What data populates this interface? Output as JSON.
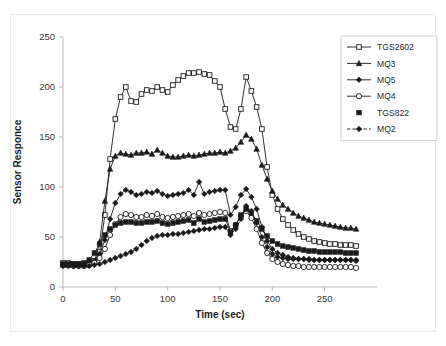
{
  "chart_data": {
    "type": "line",
    "title": "",
    "xlabel": "Time (sec)",
    "ylabel": "Sensor Responce",
    "xlim": [
      0,
      300
    ],
    "ylim": [
      0,
      250
    ],
    "xticks": [
      0,
      50,
      100,
      150,
      200,
      250
    ],
    "yticks": [
      0,
      50,
      100,
      150,
      200,
      250
    ],
    "grid": false,
    "legend_position": "top-right",
    "x": [
      0,
      5,
      10,
      15,
      20,
      25,
      30,
      35,
      40,
      45,
      50,
      55,
      60,
      65,
      70,
      75,
      80,
      85,
      90,
      95,
      100,
      105,
      110,
      115,
      120,
      125,
      130,
      135,
      140,
      145,
      150,
      155,
      160,
      165,
      170,
      175,
      180,
      185,
      190,
      195,
      200,
      205,
      210,
      215,
      220,
      225,
      230,
      235,
      240,
      245,
      250,
      255,
      260,
      265,
      270,
      275,
      280
    ],
    "series": [
      {
        "name": "TGS2602",
        "marker": "open-square",
        "dashed": false,
        "values": [
          24,
          24,
          23,
          23,
          23,
          24,
          26,
          35,
          72,
          128,
          168,
          190,
          200,
          186,
          185,
          193,
          197,
          196,
          200,
          197,
          195,
          202,
          207,
          211,
          214,
          214,
          215,
          213,
          212,
          206,
          200,
          178,
          160,
          158,
          178,
          210,
          196,
          180,
          158,
          120,
          92,
          78,
          68,
          62,
          57,
          53,
          50,
          48,
          46,
          45,
          44,
          43,
          43,
          42,
          42,
          42,
          41
        ]
      },
      {
        "name": "MQ3",
        "marker": "solid-triangle",
        "dashed": false,
        "values": [
          22,
          22,
          22,
          22,
          22,
          23,
          25,
          45,
          86,
          118,
          131,
          134,
          133,
          132,
          134,
          134,
          135,
          133,
          137,
          134,
          131,
          130,
          130,
          131,
          132,
          131,
          132,
          133,
          134,
          134,
          135,
          134,
          136,
          139,
          145,
          152,
          148,
          138,
          122,
          108,
          96,
          88,
          82,
          78,
          74,
          71,
          69,
          67,
          65,
          64,
          63,
          62,
          61,
          60,
          59,
          59,
          58
        ]
      },
      {
        "name": "MQ5",
        "marker": "solid-diamond",
        "dashed": false,
        "values": [
          22,
          22,
          22,
          22,
          22,
          23,
          26,
          33,
          47,
          68,
          84,
          93,
          97,
          95,
          92,
          93,
          95,
          94,
          96,
          93,
          91,
          92,
          93,
          94,
          97,
          92,
          105,
          93,
          95,
          96,
          97,
          97,
          72,
          80,
          92,
          98,
          90,
          78,
          60,
          46,
          38,
          34,
          32,
          30,
          29,
          28,
          28,
          27,
          27,
          27,
          27,
          27,
          27,
          27,
          27,
          27,
          26
        ]
      },
      {
        "name": "MQ4",
        "marker": "open-circle",
        "dashed": false,
        "values": [
          22,
          22,
          21,
          21,
          21,
          22,
          24,
          29,
          38,
          52,
          63,
          70,
          73,
          72,
          70,
          70,
          72,
          71,
          73,
          70,
          69,
          70,
          71,
          72,
          73,
          71,
          74,
          72,
          73,
          74,
          75,
          74,
          56,
          62,
          71,
          76,
          69,
          58,
          44,
          34,
          28,
          25,
          23,
          22,
          21,
          21,
          20,
          20,
          20,
          20,
          20,
          20,
          20,
          20,
          20,
          20,
          19
        ]
      },
      {
        "name": "TGS822",
        "marker": "solid-square",
        "dashed": false,
        "values": [
          23,
          23,
          23,
          23,
          24,
          27,
          34,
          43,
          52,
          58,
          62,
          64,
          65,
          65,
          64,
          64,
          65,
          65,
          66,
          64,
          63,
          64,
          65,
          66,
          67,
          64,
          68,
          65,
          66,
          67,
          68,
          68,
          55,
          62,
          72,
          78,
          74,
          66,
          58,
          51,
          46,
          43,
          41,
          40,
          39,
          38,
          37,
          36,
          36,
          35,
          35,
          35,
          35,
          35,
          34,
          34,
          34
        ]
      },
      {
        "name": "MQ2",
        "marker": "solid-diamond",
        "dashed": true,
        "values": [
          21,
          21,
          21,
          21,
          21,
          21,
          22,
          23,
          25,
          27,
          29,
          31,
          33,
          35,
          38,
          42,
          46,
          49,
          51,
          52,
          52,
          53,
          53,
          54,
          55,
          56,
          57,
          58,
          58,
          59,
          60,
          60,
          52,
          58,
          68,
          81,
          76,
          64,
          50,
          40,
          33,
          30,
          29,
          28,
          28,
          28,
          28,
          28,
          27,
          27,
          27,
          27,
          27,
          27,
          27,
          27,
          27
        ]
      }
    ]
  },
  "legend": {
    "entries": [
      {
        "label": "TGS2602"
      },
      {
        "label": "MQ3"
      },
      {
        "label": "MQ5"
      },
      {
        "label": "MQ4"
      },
      {
        "label": "TGS822"
      },
      {
        "label": "MQ2"
      }
    ]
  },
  "colors": {
    "line": "#1a1a1a",
    "axis": "#b9b9b9",
    "text": "#1a1a1a",
    "background": "#ffffff"
  }
}
